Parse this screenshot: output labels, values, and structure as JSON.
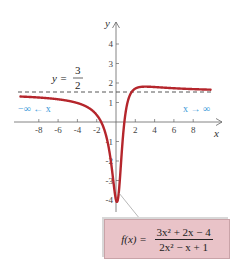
{
  "chart_data": {
    "type": "line",
    "title": "",
    "xlabel": "x",
    "ylabel": "y",
    "xlim": [
      -10,
      10
    ],
    "ylim": [
      -4.5,
      5
    ],
    "x_ticks": [
      -8,
      -6,
      -4,
      -2,
      2,
      4,
      6,
      8
    ],
    "x_tick_labels": [
      "-8",
      "-6",
      "-4",
      "-2",
      "2",
      "4",
      "6",
      "8"
    ],
    "y_ticks": [
      4,
      3,
      2,
      1,
      -1,
      -2,
      -3,
      -4
    ],
    "y_tick_labels": [
      "4",
      "3",
      "2",
      "1",
      "-1",
      "-2",
      "-3",
      "-4"
    ],
    "grid": false,
    "series": [
      {
        "name": "f(x) = (3x^2 + 2x - 4)/(2x^2 - x + 1)",
        "color": "#b5262c",
        "function": "(3x^2+2x-4)/(2x^2-x+1)",
        "x": [
          -10,
          -8,
          -6,
          -4,
          -2,
          -1,
          -0.5,
          0,
          0.25,
          0.5,
          1,
          1.5,
          2,
          3,
          4,
          6,
          8,
          10
        ],
        "y": [
          1.33,
          1.28,
          1.21,
          1.08,
          0.73,
          -0.75,
          -2.5,
          -4.0,
          -3.4,
          -1.25,
          0.5,
          1.4,
          1.71,
          1.77,
          1.71,
          1.64,
          1.6,
          1.57
        ]
      }
    ],
    "asymptote": {
      "type": "horizontal",
      "y": 1.5,
      "style": "dashed",
      "label_lhs": "y =",
      "label_num": "3",
      "label_den": "2"
    },
    "annotations": [
      {
        "text": "-∞ ← x",
        "position": "left",
        "color": "#3a9ad9"
      },
      {
        "text": "x → ∞",
        "position": "right",
        "color": "#3a9ad9"
      }
    ],
    "formula_box": {
      "lhs": "f(x) =",
      "numerator": "3x² + 2x − 4",
      "denominator": "2x² − x + 1",
      "background": "#e9c3c8"
    }
  },
  "labels": {
    "x_axis": "x",
    "y_axis": "y",
    "asym_lhs": "y =",
    "asym_num": "3",
    "asym_den": "2",
    "left_limit": "−∞ ← x",
    "right_limit": "x → ∞",
    "formula_lhs": "f(x) =",
    "formula_num": "3x² + 2x − 4",
    "formula_den": "2x² − x + 1"
  }
}
